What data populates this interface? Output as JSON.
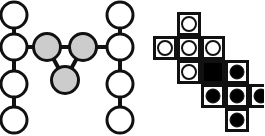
{
  "figure": {
    "canvas": {
      "width": 264,
      "height": 136,
      "background": "#ffffff"
    },
    "panels": [
      {
        "id": "graph-panel",
        "name": "node-link-graph",
        "x": 0,
        "y": 0,
        "width": 140,
        "height": 136
      },
      {
        "id": "grid-panel",
        "name": "cell-grid-diagram",
        "x": 140,
        "y": 0,
        "width": 124,
        "height": 136
      }
    ]
  },
  "style": {
    "stroke": "#111111",
    "node_fill_white": "#ffffff",
    "node_fill_gray": "#cccccc",
    "node_fill_black": "#000000",
    "cell_fill_white": "#ffffff",
    "cell_fill_black": "#000000",
    "node_stroke_width": 3,
    "edge_stroke_width": 4,
    "cell_stroke_width": 3,
    "node_radius": 13,
    "gray_node_radius": 13.5,
    "cell_size": 24,
    "dot_radius": 7
  },
  "graph": {
    "nodes": [
      {
        "id": "L1",
        "cx": 14,
        "cy": 15,
        "r": 13,
        "fill": "#ffffff",
        "label": "left-column-node-1"
      },
      {
        "id": "L2",
        "cx": 14,
        "cy": 47,
        "r": 13,
        "fill": "#ffffff",
        "label": "left-column-node-2"
      },
      {
        "id": "L3",
        "cx": 14,
        "cy": 84,
        "r": 13,
        "fill": "#ffffff",
        "label": "left-column-node-3"
      },
      {
        "id": "L4",
        "cx": 14,
        "cy": 120,
        "r": 13,
        "fill": "#ffffff",
        "label": "left-column-node-4"
      },
      {
        "id": "R1",
        "cx": 120,
        "cy": 15,
        "r": 13,
        "fill": "#ffffff",
        "label": "right-column-node-1"
      },
      {
        "id": "R2",
        "cx": 120,
        "cy": 47,
        "r": 13,
        "fill": "#ffffff",
        "label": "right-column-node-2"
      },
      {
        "id": "R3",
        "cx": 120,
        "cy": 84,
        "r": 13,
        "fill": "#ffffff",
        "label": "right-column-node-3"
      },
      {
        "id": "R4",
        "cx": 120,
        "cy": 120,
        "r": 13,
        "fill": "#ffffff",
        "label": "right-column-node-4"
      },
      {
        "id": "G1",
        "cx": 47,
        "cy": 47,
        "r": 13.5,
        "fill": "#cccccc",
        "label": "center-gray-node-left"
      },
      {
        "id": "G2",
        "cx": 83,
        "cy": 47,
        "r": 13.5,
        "fill": "#cccccc",
        "label": "center-gray-node-right"
      },
      {
        "id": "G3",
        "cx": 65,
        "cy": 80,
        "r": 13.5,
        "fill": "#cccccc",
        "label": "center-gray-node-bottom"
      }
    ],
    "edges": [
      {
        "from": "L1",
        "to": "L2",
        "label": "edge-left-1-2"
      },
      {
        "from": "L2",
        "to": "L3",
        "label": "edge-left-2-3"
      },
      {
        "from": "L3",
        "to": "L4",
        "label": "edge-left-3-4"
      },
      {
        "from": "R1",
        "to": "R2",
        "label": "edge-right-1-2"
      },
      {
        "from": "R2",
        "to": "R3",
        "label": "edge-right-2-3"
      },
      {
        "from": "R3",
        "to": "R4",
        "label": "edge-right-3-4"
      },
      {
        "from": "L2",
        "to": "G1",
        "label": "edge-left2-gray-left"
      },
      {
        "from": "G1",
        "to": "G2",
        "label": "edge-gray-left-right"
      },
      {
        "from": "G2",
        "to": "R2",
        "label": "edge-gray-right-right2"
      },
      {
        "from": "G1",
        "to": "G3",
        "label": "edge-gray-left-bottom"
      },
      {
        "from": "G2",
        "to": "G3",
        "label": "edge-gray-right-bottom"
      }
    ],
    "counts": {
      "white_nodes": 8,
      "gray_nodes": 3,
      "edges": 11
    }
  },
  "grid": {
    "origin_x": 13,
    "origin_y": 12,
    "cell_size": 24,
    "columns": 5,
    "rows": 5,
    "cells": [
      {
        "col": 1,
        "row": 0,
        "fill": "#ffffff",
        "marker": "open-circle",
        "label": "cell-c1-r0"
      },
      {
        "col": 0,
        "row": 1,
        "fill": "#ffffff",
        "marker": "open-circle",
        "label": "cell-c0-r1"
      },
      {
        "col": 1,
        "row": 1,
        "fill": "#ffffff",
        "marker": "open-circle",
        "label": "cell-c1-r1"
      },
      {
        "col": 2,
        "row": 1,
        "fill": "#ffffff",
        "marker": "open-circle",
        "label": "cell-c2-r1"
      },
      {
        "col": 1,
        "row": 2,
        "fill": "#ffffff",
        "marker": "open-circle",
        "label": "cell-c1-r2"
      },
      {
        "col": 2,
        "row": 2,
        "fill": "#000000",
        "marker": "none",
        "label": "cell-c2-r2-solid"
      },
      {
        "col": 3,
        "row": 2,
        "fill": "#ffffff",
        "marker": "filled-circle",
        "label": "cell-c3-r2"
      },
      {
        "col": 2,
        "row": 3,
        "fill": "#ffffff",
        "marker": "filled-circle",
        "label": "cell-c2-r3"
      },
      {
        "col": 3,
        "row": 3,
        "fill": "#ffffff",
        "marker": "filled-circle",
        "label": "cell-c3-r3"
      },
      {
        "col": 4,
        "row": 3,
        "fill": "#ffffff",
        "marker": "filled-circle",
        "label": "cell-c4-r3"
      },
      {
        "col": 3,
        "row": 4,
        "fill": "#ffffff",
        "marker": "filled-circle",
        "label": "cell-c3-r4"
      }
    ],
    "counts": {
      "total_cells": 11,
      "open_circles": 5,
      "filled_circles": 5,
      "solid_black": 1
    }
  }
}
